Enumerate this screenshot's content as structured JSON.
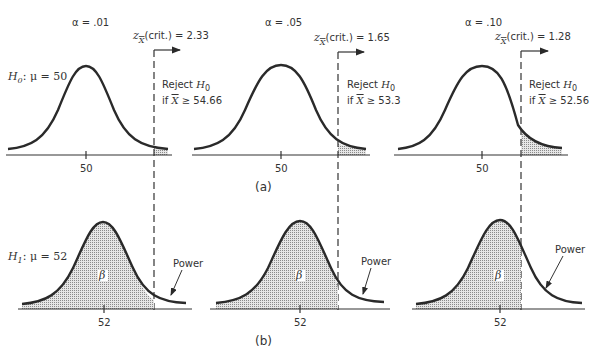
{
  "figure": {
    "row_a_caption": "(a)",
    "row_b_caption": "(b)",
    "h0_label": "H",
    "h0_sub": "0",
    "h0_rest": ": μ = 50",
    "h1_label": "H",
    "h1_sub": "1",
    "h1_rest": ": μ = 52",
    "beta_label": "β",
    "power_label": "Power",
    "reject_prefix": "Reject ",
    "reject_h": "H",
    "reject_sub": "0",
    "if_prefix": "if ",
    "xbar": "X",
    "geq": " ≥ ",
    "z_symbol": "z",
    "z_sub": "X",
    "crit_text": "(crit.) = ",
    "colors": {
      "ink": "#2a2a2a",
      "shade": "#c8c8c8",
      "background": "#ffffff"
    }
  },
  "panels": [
    {
      "alpha_label": "α = .01",
      "z_crit": "2.33",
      "reject_value": "54.66",
      "h0_tick": "50",
      "h1_tick": "52"
    },
    {
      "alpha_label": "α = .05",
      "z_crit": "1.65",
      "reject_value": "53.3",
      "h0_tick": "50",
      "h1_tick": "52"
    },
    {
      "alpha_label": "α = .10",
      "z_crit": "1.28",
      "reject_value": "52.56",
      "h0_tick": "50",
      "h1_tick": "52"
    }
  ]
}
